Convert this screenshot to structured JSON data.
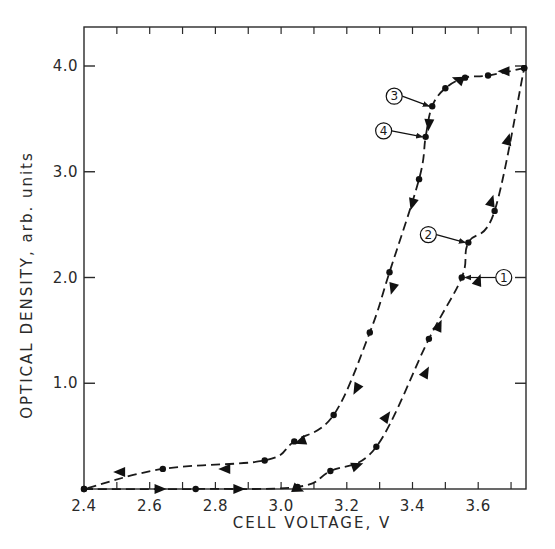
{
  "chart_data": {
    "type": "line",
    "title": "",
    "xlabel": "CELL VOLTAGE, V",
    "ylabel": "OPTICAL DENSITY, arb. units",
    "xlim": [
      2.4,
      3.75
    ],
    "ylim": [
      0.0,
      4.35
    ],
    "x_ticks": [
      2.4,
      2.6,
      2.8,
      3.0,
      3.2,
      3.4,
      3.6
    ],
    "x_tick_labels": [
      "2.4",
      "2.6",
      "2.8",
      "3.0",
      "3.2",
      "3.4",
      "3.6"
    ],
    "y_ticks": [
      1.0,
      2.0,
      3.0,
      4.0
    ],
    "y_tick_labels": [
      "1.0",
      "2.0",
      "3.0",
      "4.0"
    ],
    "grid": false,
    "legend": null,
    "line_style": "dashed",
    "series": [
      {
        "name": "Charging (increasing voltage)",
        "direction": "forward",
        "x": [
          2.4,
          2.74,
          3.05,
          3.15,
          3.29,
          3.45,
          3.55,
          3.57,
          3.65,
          3.74
        ],
        "y": [
          0.0,
          0.0,
          0.02,
          0.17,
          0.4,
          1.42,
          2.0,
          2.33,
          2.63,
          3.98
        ]
      },
      {
        "name": "Discharging (decreasing voltage)",
        "direction": "reverse",
        "x": [
          3.74,
          3.63,
          3.56,
          3.5,
          3.46,
          3.44,
          3.42,
          3.33,
          3.27,
          3.16,
          3.04,
          2.95,
          2.64,
          2.4
        ],
        "y": [
          3.98,
          3.91,
          3.89,
          3.79,
          3.62,
          3.33,
          2.93,
          2.05,
          1.48,
          0.7,
          0.45,
          0.27,
          0.19,
          0.0
        ]
      }
    ],
    "annotations": [
      {
        "label": "1",
        "x": 3.55,
        "y": 2.0
      },
      {
        "label": "2",
        "x": 3.57,
        "y": 2.33
      },
      {
        "label": "3",
        "x": 3.46,
        "y": 3.62
      },
      {
        "label": "4",
        "x": 3.44,
        "y": 3.33
      }
    ]
  }
}
